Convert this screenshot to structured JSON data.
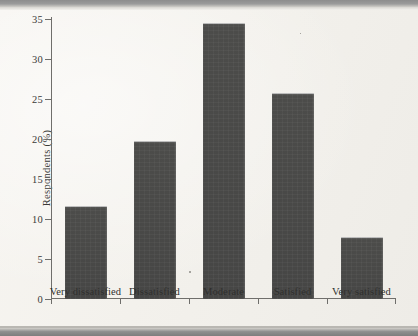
{
  "figure": {
    "y_axis_label": "Respondents (%)",
    "y_ticks": [
      "0",
      "5",
      "10",
      "15",
      "20",
      "25",
      "30",
      "35"
    ]
  },
  "chart_data": {
    "type": "bar",
    "title": "",
    "xlabel": "",
    "ylabel": "Respondents (%)",
    "categories": [
      "Very dissatisfied",
      "Dissatisfied",
      "Moderate",
      "Satisfied",
      "Very satisfied"
    ],
    "values": [
      11.6,
      19.7,
      34.5,
      25.7,
      7.7
    ],
    "ylim": [
      0,
      35
    ],
    "ytick_values": [
      0,
      5,
      10,
      15,
      20,
      25,
      30,
      35
    ],
    "grid": false,
    "legend": null,
    "bar_color": "#4a4a48",
    "axis_color": "#6f6e6b",
    "background_color": "#f3f1ec"
  }
}
